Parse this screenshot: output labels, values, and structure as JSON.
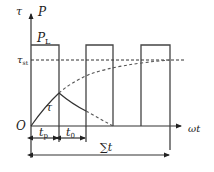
{
  "diagram": {
    "type": "pulse-temperature-timing",
    "axes": {
      "y_left_label": "τ",
      "y_right_label": "P",
      "x_label": "ωt",
      "origin_label": "O"
    },
    "labels": {
      "pulse_level": "P",
      "pulse_level_sub": "L",
      "steady_temp": "τ",
      "steady_temp_sub": "st",
      "curve_label": "τ",
      "pulse_width": "t",
      "pulse_width_sub": "p",
      "off_time": "t",
      "off_time_sub": "0",
      "total_time": "∑t"
    },
    "pulses": [
      {
        "start": 31,
        "end": 59
      },
      {
        "start": 86,
        "end": 113
      },
      {
        "start": 141,
        "end": 170
      }
    ],
    "colors": {
      "stroke": "#333333",
      "background": "#ffffff"
    }
  }
}
